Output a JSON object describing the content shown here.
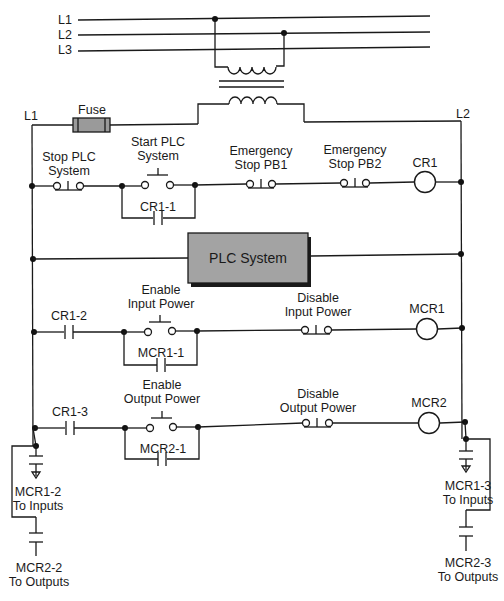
{
  "supply": {
    "lines": [
      "L1",
      "L2",
      "L3"
    ]
  },
  "control_circuit": {
    "left_rail_label": "L1",
    "right_rail_label": "L2",
    "fuse_label": "Fuse",
    "fuse_color": "#9a9a9a"
  },
  "rungs": [
    {
      "id": "rung-1",
      "elements": [
        {
          "type": "nc-pushbutton",
          "label_line1": "Stop PLC",
          "label_line2": "System"
        },
        {
          "type": "no-pushbutton",
          "label_line1": "Start PLC",
          "label_line2": "System"
        },
        {
          "type": "no-contact-seal",
          "label": "CR1-1"
        },
        {
          "type": "nc-pushbutton",
          "label_line1": "Emergency",
          "label_line2": "Stop PB1"
        },
        {
          "type": "nc-pushbutton",
          "label_line1": "Emergency",
          "label_line2": "Stop PB2"
        },
        {
          "type": "coil",
          "label": "CR1"
        }
      ]
    },
    {
      "id": "rung-2",
      "elements": [
        {
          "type": "block",
          "label": "PLC System",
          "fill": "#a3a3a3"
        }
      ]
    },
    {
      "id": "rung-3",
      "elements": [
        {
          "type": "no-contact",
          "label": "CR1-2"
        },
        {
          "type": "no-pushbutton",
          "label_line1": "Enable",
          "label_line2": "Input Power"
        },
        {
          "type": "no-contact-seal",
          "label": "MCR1-1"
        },
        {
          "type": "nc-pushbutton",
          "label_line1": "Disable",
          "label_line2": "Input Power"
        },
        {
          "type": "coil",
          "label": "MCR1"
        }
      ]
    },
    {
      "id": "rung-4",
      "elements": [
        {
          "type": "no-contact",
          "label": "CR1-3"
        },
        {
          "type": "no-pushbutton",
          "label_line1": "Enable",
          "label_line2": "Output Power"
        },
        {
          "type": "no-contact-seal",
          "label": "MCR2-1"
        },
        {
          "type": "nc-pushbutton",
          "label_line1": "Disable",
          "label_line2": "Output Power"
        },
        {
          "type": "coil",
          "label": "MCR2"
        }
      ]
    }
  ],
  "outputs": {
    "left": [
      {
        "label_line1": "MCR1-2",
        "label_line2": "To Inputs"
      },
      {
        "label_line1": "MCR2-2",
        "label_line2": "To Outputs"
      }
    ],
    "right": [
      {
        "label_line1": "MCR1-3",
        "label_line2": "To Inputs"
      },
      {
        "label_line1": "MCR2-3",
        "label_line2": "To Outputs"
      }
    ]
  }
}
